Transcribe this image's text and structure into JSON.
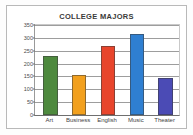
{
  "chart_data": {
    "type": "bar",
    "title": "COLLEGE MAJORS",
    "xlabel": "",
    "ylabel": "",
    "categories": [
      "Art",
      "Business",
      "English",
      "Music",
      "Theater"
    ],
    "values": [
      230,
      155,
      270,
      315,
      145
    ],
    "colors": [
      "#4e8a3e",
      "#f2a01e",
      "#e8452c",
      "#2f7fd1",
      "#4b4bb5"
    ],
    "ylim": [
      0,
      350
    ],
    "yticks": [
      0,
      50,
      100,
      150,
      200,
      250,
      300,
      350
    ],
    "ytick_labels": [
      "0",
      "50",
      "100",
      "150",
      "200",
      "250",
      "300",
      "350"
    ],
    "grid": true,
    "legend": false,
    "legend_position": "none"
  },
  "frame": {
    "border_color": "#b9b9b9",
    "background": "#ffffff"
  }
}
